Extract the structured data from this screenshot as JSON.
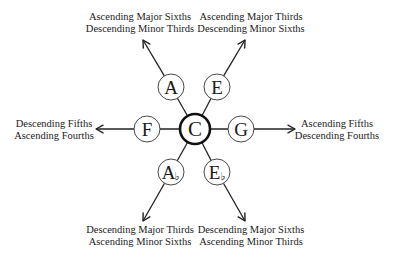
{
  "diagram": {
    "center": {
      "label": "C",
      "x": 195,
      "y": 129,
      "r": 15
    },
    "nodes": [
      {
        "id": "A",
        "label": "A",
        "accidental": "",
        "x": 171,
        "y": 87,
        "r": 13,
        "direction": "up-left",
        "arrow_tip": [
          143,
          40
        ],
        "caption": [
          "Ascending Major Sixths",
          "Descending Minor Thirds"
        ],
        "caption_x": 140,
        "caption_y": [
          20,
          32
        ]
      },
      {
        "id": "E",
        "label": "E",
        "accidental": "",
        "x": 217,
        "y": 87,
        "r": 13,
        "direction": "up-right",
        "arrow_tip": [
          245,
          40
        ],
        "caption": [
          "Ascending Major Thirds",
          "Descending Minor Sixths"
        ],
        "caption_x": 251,
        "caption_y": [
          20,
          32
        ]
      },
      {
        "id": "F",
        "label": "F",
        "accidental": "",
        "x": 147,
        "y": 129,
        "r": 13,
        "direction": "left",
        "arrow_tip": [
          96,
          129
        ],
        "caption": [
          "Descending Fifths",
          "Ascending Fourths"
        ],
        "caption_x": 54,
        "caption_y": [
          127,
          139
        ]
      },
      {
        "id": "G",
        "label": "G",
        "accidental": "",
        "x": 241,
        "y": 129,
        "r": 13,
        "direction": "right",
        "arrow_tip": [
          295,
          129
        ],
        "caption": [
          "Ascending Fifths",
          "Descending Fourths"
        ],
        "caption_x": 337,
        "caption_y": [
          127,
          139
        ]
      },
      {
        "id": "Ab",
        "label": "A",
        "accidental": "♭",
        "x": 171,
        "y": 172,
        "r": 13,
        "direction": "down-left",
        "arrow_tip": [
          143,
          221
        ],
        "caption": [
          "Descending Major Thirds",
          "Ascending Minor Sixths"
        ],
        "caption_x": 140,
        "caption_y": [
          233,
          245
        ]
      },
      {
        "id": "Eb",
        "label": "E",
        "accidental": "♭",
        "x": 217,
        "y": 172,
        "r": 13,
        "direction": "down-right",
        "arrow_tip": [
          245,
          221
        ],
        "caption": [
          "Descending Major Sixths",
          "Ascending Minor Thirds"
        ],
        "caption_x": 251,
        "caption_y": [
          233,
          245
        ]
      }
    ],
    "colors": {
      "stroke": "#222222",
      "text": "#1a1a1a",
      "background": "#ffffff"
    }
  }
}
